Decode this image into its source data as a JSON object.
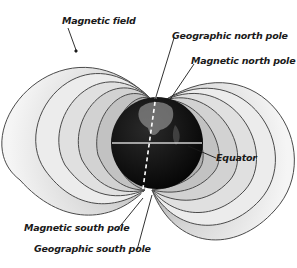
{
  "diagram": {
    "labels": {
      "magnetic_field": "Magnetic field",
      "geographic_north_pole": "Geographic north pole",
      "magnetic_north_pole": "Magnetic north pole",
      "equator": "Equator",
      "magnetic_south_pole": "Magnetic south pole",
      "geographic_south_pole": "Geographic south pole"
    },
    "colors": {
      "earth": "#0d0d0d",
      "field_line": "#4a4a4a",
      "field_fill_outer": "#f2f2f2",
      "field_fill_inner": "#bdbdbd",
      "label_text": "#1a1a1a",
      "axis_dash": "#ffffff"
    },
    "field_line_count_per_side": 6
  }
}
